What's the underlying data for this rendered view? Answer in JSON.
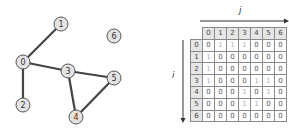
{
  "graph": {
    "nodes": [
      {
        "id": "0",
        "x": 23,
        "y": 62
      },
      {
        "id": "1",
        "x": 61,
        "y": 24
      },
      {
        "id": "2",
        "x": 23,
        "y": 105
      },
      {
        "id": "3",
        "x": 68,
        "y": 71
      },
      {
        "id": "4",
        "x": 76,
        "y": 117
      },
      {
        "id": "5",
        "x": 114,
        "y": 78
      },
      {
        "id": "6",
        "x": 114,
        "y": 36
      }
    ],
    "edges": [
      [
        "0",
        "1"
      ],
      [
        "0",
        "2"
      ],
      [
        "0",
        "3"
      ],
      [
        "3",
        "4"
      ],
      [
        "3",
        "5"
      ],
      [
        "4",
        "5"
      ]
    ],
    "node_fill": "#e3e3e3",
    "node_stroke": "#555555",
    "edge_color": "#444444"
  },
  "matrix": {
    "col_axis_label": "j",
    "row_axis_label": "i",
    "col_headers": [
      "0",
      "1",
      "2",
      "3",
      "4",
      "5",
      "6"
    ],
    "row_headers": [
      "0",
      "1",
      "2",
      "3",
      "4",
      "5",
      "6"
    ],
    "rows": [
      [
        "0",
        "1",
        "1",
        "1",
        "0",
        "0",
        "0"
      ],
      [
        "1",
        "0",
        "0",
        "0",
        "0",
        "0",
        "0"
      ],
      [
        "1",
        "0",
        "0",
        "0",
        "0",
        "0",
        "0"
      ],
      [
        "1",
        "0",
        "0",
        "0",
        "1",
        "1",
        "0"
      ],
      [
        "0",
        "0",
        "0",
        "1",
        "0",
        "1",
        "0"
      ],
      [
        "0",
        "0",
        "0",
        "1",
        "1",
        "0",
        "0"
      ],
      [
        "0",
        "0",
        "0",
        "0",
        "0",
        "0",
        "0"
      ]
    ]
  }
}
